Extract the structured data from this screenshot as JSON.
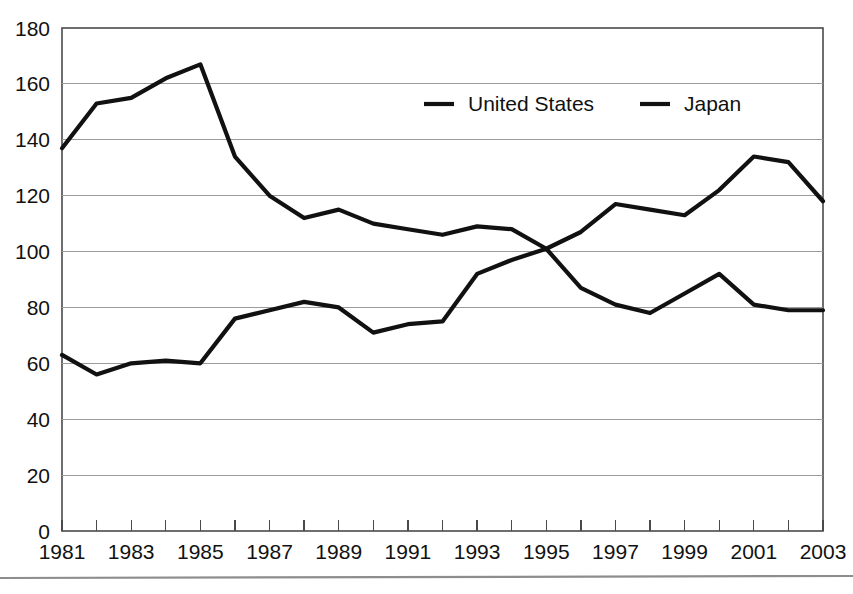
{
  "chart_data": {
    "type": "line",
    "title": "",
    "subtitle": "",
    "xlabel": "",
    "ylabel": "",
    "x": [
      1981,
      1982,
      1983,
      1984,
      1985,
      1986,
      1987,
      1988,
      1989,
      1990,
      1991,
      1992,
      1993,
      1994,
      1995,
      1996,
      1997,
      1998,
      1999,
      2000,
      2001,
      2002,
      2003
    ],
    "xlim": [
      1981,
      2003
    ],
    "ylim": [
      0,
      180
    ],
    "yticks": [
      0,
      20,
      40,
      60,
      80,
      100,
      120,
      140,
      160,
      180
    ],
    "ytick_labels": [
      "0",
      "20",
      "40",
      "60",
      "80",
      "100",
      "120",
      "140",
      "160",
      "180"
    ],
    "xticks": [
      1981,
      1983,
      1985,
      1987,
      1989,
      1991,
      1993,
      1995,
      1997,
      1999,
      2001,
      2003
    ],
    "xtick_labels": [
      "1981",
      "1983",
      "1985",
      "1987",
      "1989",
      "1991",
      "1993",
      "1995",
      "1997",
      "1999",
      "2001",
      "2003"
    ],
    "minor_xticks_every": 1,
    "grid": "horizontal",
    "legend_position": "top-center-inside",
    "series": [
      {
        "name": "United States",
        "color": "#111111",
        "values": [
          137,
          153,
          155,
          162,
          167,
          134,
          120,
          112,
          115,
          110,
          108,
          106,
          109,
          108,
          101,
          87,
          81,
          78,
          85,
          92,
          81,
          79,
          79
        ]
      },
      {
        "name": "Japan",
        "color": "#111111",
        "values": [
          63,
          56,
          60,
          61,
          60,
          76,
          79,
          82,
          80,
          71,
          74,
          75,
          92,
          97,
          101,
          107,
          117,
          115,
          113,
          122,
          134,
          132,
          118
        ]
      }
    ]
  },
  "legend": {
    "entries": [
      {
        "label": "United States"
      },
      {
        "label": "Japan"
      }
    ]
  },
  "colors": {
    "line": "#111111",
    "grid": "#9b9b9b",
    "frame": "#4a4a4a",
    "text": "#111111",
    "background": "#ffffff",
    "footer_rule": "#8d8d8d"
  }
}
